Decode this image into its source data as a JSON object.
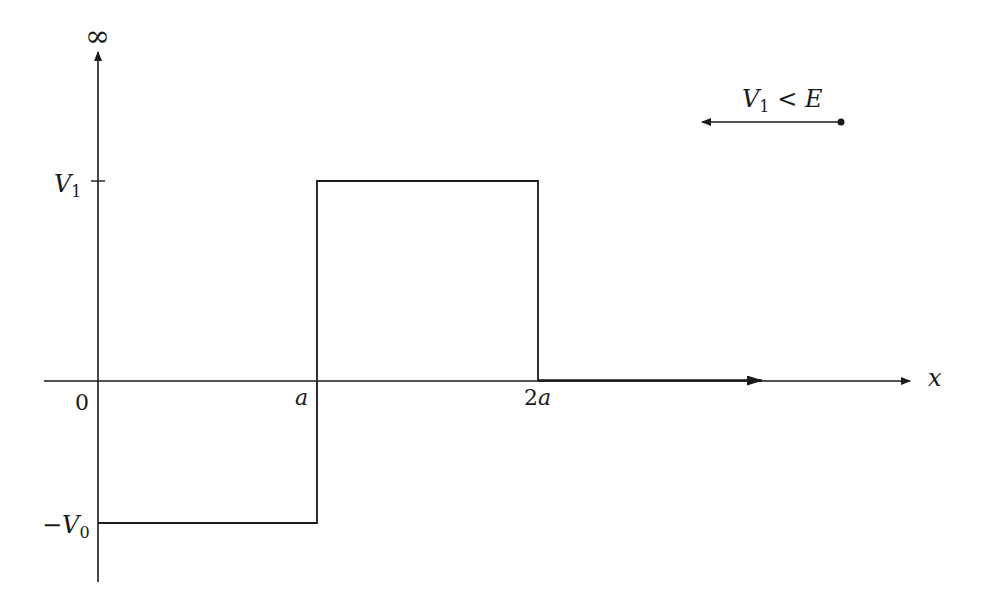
{
  "diagram": {
    "type": "potential-well-barrier",
    "y_axis_top_label": "∞",
    "x_axis_label": "x",
    "y_labels": {
      "v1": "V",
      "v1_sub": "1",
      "neg_v0_prefix": "−",
      "v0": "V",
      "v0_sub": "0"
    },
    "x_ticks": {
      "origin": "0",
      "a": "a",
      "two_a_num": "2",
      "two_a_var": "a"
    },
    "annotation": {
      "v": "V",
      "sub": "1",
      "rel": " < ",
      "e": "E"
    },
    "colors": {
      "line": "#1a1a1a",
      "background": "#ffffff"
    }
  }
}
